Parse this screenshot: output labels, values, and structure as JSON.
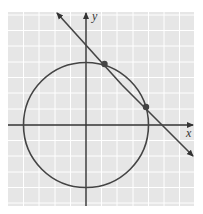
{
  "figure": {
    "type": "coordinate-plane-graph",
    "x_axis_label": "x",
    "y_axis_label": "y",
    "grid": {
      "x_min": -5,
      "x_max": 7,
      "y_min": -5,
      "y_max": 7,
      "cell_units": 1
    },
    "circle": {
      "center": [
        0,
        0
      ],
      "radius": 4,
      "equation": "x^2 + y^2 = 16"
    },
    "line": {
      "equation": "x + y = 5",
      "y_intercept": 5,
      "x_intercept": 5
    },
    "intersection_points": [
      [
        1.2,
        3.8
      ],
      [
        3.8,
        1.2
      ]
    ],
    "colors": {
      "grid_bg": "#e6e6e6",
      "grid_line": "#ffffff",
      "stroke": "#444444"
    }
  }
}
